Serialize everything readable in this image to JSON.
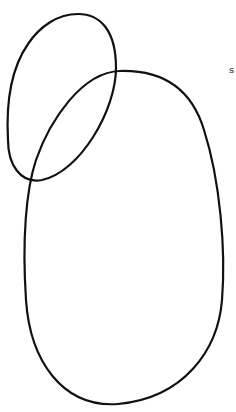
{
  "diagram": {
    "shapes": [
      {
        "name": "small-oval",
        "stroke": "#111111"
      },
      {
        "name": "large-oval",
        "stroke": "#111111"
      }
    ],
    "annotation": "s"
  }
}
